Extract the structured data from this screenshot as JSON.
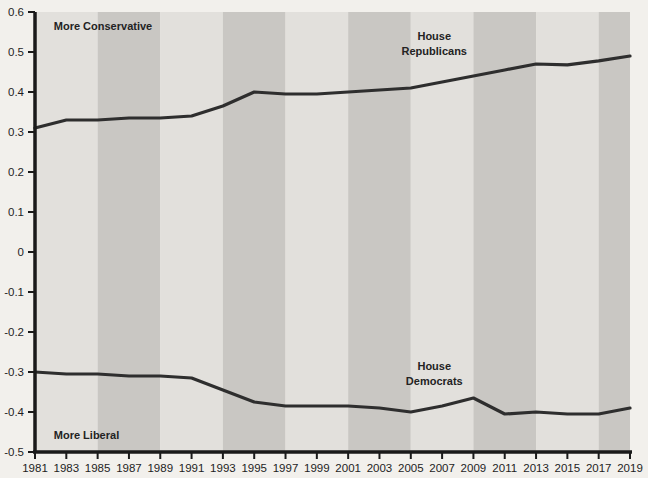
{
  "chart_data": {
    "type": "line",
    "title": "",
    "subtitle": "",
    "xlabel": "",
    "ylabel": "",
    "xlim": [
      1981,
      2019
    ],
    "ylim": [
      -0.5,
      0.6
    ],
    "grid": false,
    "legend_position": "inline-labels",
    "x": [
      1981,
      1983,
      1985,
      1987,
      1989,
      1991,
      1993,
      1995,
      1997,
      1999,
      2001,
      2003,
      2005,
      2007,
      2009,
      2011,
      2013,
      2015,
      2017,
      2019
    ],
    "xticklabels": [
      "1981",
      "1983",
      "1985",
      "1987",
      "1989",
      "1991",
      "1993",
      "1995",
      "1997",
      "1999",
      "2001",
      "2003",
      "2005",
      "2007",
      "2009",
      "2011",
      "2013",
      "2015",
      "2017",
      "2019"
    ],
    "yticks": [
      -0.5,
      -0.4,
      -0.3,
      -0.2,
      -0.1,
      0,
      0.1,
      0.2,
      0.3,
      0.4,
      0.5,
      0.6
    ],
    "yticklabels": [
      "-0.5",
      "-0.4",
      "-0.3",
      "-0.2",
      "-0.1",
      "0",
      "0.1",
      "0.2",
      "0.3",
      "0.4",
      "0.5",
      "0.6"
    ],
    "series": [
      {
        "name": "House Republicans",
        "color": "#2e2e2e",
        "values": [
          0.31,
          0.33,
          0.33,
          0.335,
          0.335,
          0.34,
          0.365,
          0.4,
          0.395,
          0.395,
          0.4,
          0.405,
          0.41,
          0.425,
          0.44,
          0.455,
          0.47,
          0.468,
          0.478,
          0.49
        ]
      },
      {
        "name": "House Democrats",
        "color": "#2e2e2e",
        "values": [
          -0.3,
          -0.305,
          -0.305,
          -0.31,
          -0.31,
          -0.315,
          -0.345,
          -0.375,
          -0.385,
          -0.385,
          -0.385,
          -0.39,
          -0.4,
          -0.385,
          -0.365,
          -0.405,
          -0.4,
          -0.405,
          -0.405,
          -0.39
        ]
      }
    ],
    "annotations": [
      {
        "name": "more-conservative",
        "text": "More Conservative",
        "x": 1982.2,
        "y": 0.555
      },
      {
        "name": "more-liberal",
        "text": "More Liberal",
        "x": 1982.2,
        "y": -0.468
      }
    ],
    "series_labels": [
      {
        "name": "house-republicans-label",
        "line1": "House",
        "line2": "Republicans",
        "x": 2006.5,
        "y": 0.53
      },
      {
        "name": "house-democrats-label",
        "line1": "House",
        "line2": "Democrats",
        "x": 2006.5,
        "y": -0.295
      }
    ],
    "bands": {
      "description": "alternating 4-year shaded background bands",
      "light_color": "#e2e0dc",
      "dark_color": "#c9c7c3",
      "starts": [
        1981,
        1985,
        1989,
        1993,
        1997,
        2001,
        2005,
        2009,
        2013,
        2017
      ],
      "width_years": 4
    },
    "colors": {
      "page_background": "#f2f0ec",
      "axis": "#1a1a1a",
      "line": "#2e2e2e",
      "text": "#1e1e1e"
    }
  }
}
